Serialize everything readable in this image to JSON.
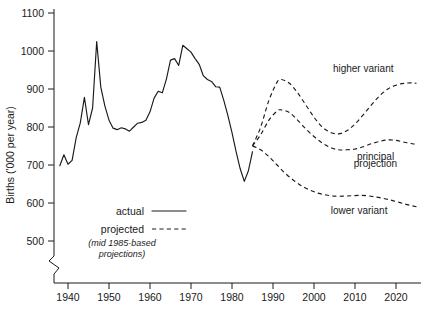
{
  "chart_data": {
    "type": "line",
    "title": "",
    "xlabel": "",
    "ylabel": "Births ('000 per year)",
    "xlim": [
      1936,
      2026
    ],
    "ylim": [
      470,
      1100
    ],
    "grid": false,
    "axis_break": true,
    "axis_break_note": "zigzag break on y-axis below 500",
    "legend_position": "inside-lower-left",
    "x_ticks": [
      1940,
      1950,
      1960,
      1970,
      1980,
      1990,
      2000,
      2010,
      2020
    ],
    "x_tick_labels": [
      "1940",
      "1950",
      "1960",
      "1970",
      "1980",
      "1990",
      "2000",
      "2010",
      "2020"
    ],
    "y_ticks": [
      500,
      600,
      700,
      800,
      900,
      1000,
      1100
    ],
    "y_tick_labels": [
      "500",
      "600",
      "700",
      "800",
      "900",
      "1000",
      "1100"
    ],
    "series": [
      {
        "name": "actual",
        "style": "solid",
        "color": "#1a1a1a",
        "x": [
          1938,
          1939,
          1940,
          1941,
          1942,
          1943,
          1944,
          1945,
          1946,
          1947,
          1948,
          1949,
          1950,
          1951,
          1952,
          1953,
          1954,
          1955,
          1956,
          1957,
          1958,
          1959,
          1960,
          1961,
          1962,
          1963,
          1964,
          1965,
          1966,
          1967,
          1968,
          1969,
          1970,
          1971,
          1972,
          1973,
          1974,
          1975,
          1976,
          1977,
          1978,
          1979,
          1980,
          1981,
          1982,
          1983,
          1984,
          1985
        ],
        "values": [
          698,
          727,
          702,
          712,
          772,
          811,
          878,
          806,
          850,
          1025,
          905,
          855,
          818,
          797,
          793,
          798,
          795,
          789,
          800,
          810,
          812,
          818,
          840,
          876,
          894,
          890,
          926,
          976,
          980,
          962,
          1015,
          1006,
          997,
          980,
          965,
          935,
          925,
          920,
          906,
          905,
          870,
          830,
          785,
          735,
          690,
          657,
          685,
          735
        ],
        "note": "plotted as a dense annual series; the line is drawn through all points"
      },
      {
        "name": "higher variant",
        "style": "dashed",
        "color": "#1a1a1a",
        "x": [
          1985,
          1987,
          1989,
          1991,
          1992,
          1994,
          1996,
          1998,
          2000,
          2002,
          2004,
          2006,
          2008,
          2010,
          2012,
          2014,
          2016,
          2018,
          2020,
          2022,
          2024,
          2025
        ],
        "values": [
          750,
          800,
          870,
          918,
          925,
          915,
          890,
          858,
          826,
          800,
          786,
          782,
          790,
          808,
          832,
          858,
          882,
          900,
          910,
          915,
          916,
          915
        ]
      },
      {
        "name": "principal projection",
        "style": "dashed",
        "color": "#1a1a1a",
        "x": [
          1985,
          1987,
          1989,
          1991,
          1992,
          1994,
          1996,
          1998,
          2000,
          2002,
          2004,
          2006,
          2008,
          2010,
          2012,
          2014,
          2016,
          2018,
          2020,
          2022,
          2024,
          2025
        ],
        "values": [
          750,
          780,
          818,
          842,
          845,
          838,
          818,
          795,
          775,
          758,
          746,
          740,
          740,
          742,
          748,
          756,
          762,
          766,
          765,
          760,
          756,
          755
        ]
      },
      {
        "name": "lower variant",
        "style": "dashed",
        "color": "#1a1a1a",
        "x": [
          1985,
          1987,
          1989,
          1991,
          1993,
          1995,
          1997,
          1999,
          2001,
          2003,
          2005,
          2007,
          2009,
          2011,
          2013,
          2015,
          2017,
          2019,
          2021,
          2023,
          2025
        ],
        "values": [
          750,
          740,
          722,
          700,
          678,
          660,
          645,
          634,
          626,
          621,
          618,
          618,
          619,
          620,
          619,
          616,
          612,
          607,
          601,
          595,
          590
        ]
      }
    ],
    "annotations": [
      {
        "text": "higher variant",
        "x": 2012,
        "y": 945
      },
      {
        "text": "principal",
        "x": 2015,
        "y": 712
      },
      {
        "text": "projection",
        "x": 2015,
        "y": 694
      },
      {
        "text": "lower variant",
        "x": 2011,
        "y": 571
      }
    ],
    "legend": {
      "entries": [
        {
          "label": "actual",
          "style": "solid"
        },
        {
          "label": "projected",
          "style": "dashed"
        }
      ],
      "note_line1": "(mid 1985-based",
      "note_line2": "projections)"
    }
  }
}
